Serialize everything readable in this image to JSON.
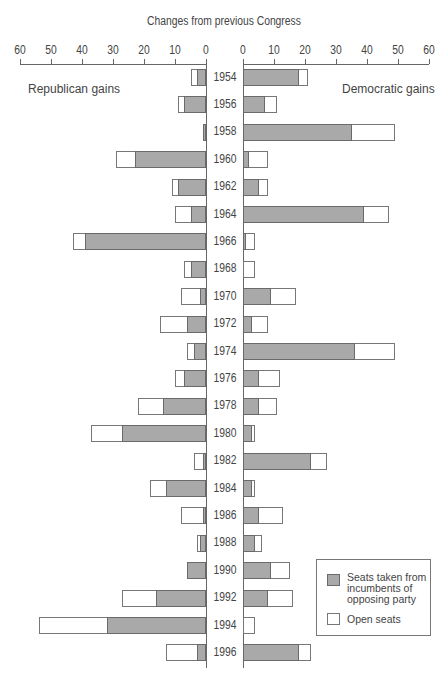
{
  "chart_data": {
    "type": "bar",
    "orientation": "horizontal-diverging",
    "title": "Changes from previous Congress",
    "left_label": "Republican gains",
    "right_label": "Democratic gains",
    "axis_ticks": [
      60,
      50,
      40,
      30,
      20,
      10,
      0
    ],
    "xlim": [
      0,
      60
    ],
    "categories": [
      "1954",
      "1956",
      "1958",
      "1960",
      "1962",
      "1964",
      "1966",
      "1968",
      "1970",
      "1972",
      "1974",
      "1976",
      "1978",
      "1980",
      "1982",
      "1984",
      "1986",
      "1988",
      "1990",
      "1992",
      "1994",
      "1996"
    ],
    "series": [
      {
        "name": "Republican gains - Seats taken from incumbents of opposing party",
        "side": "left",
        "values": [
          3,
          7,
          1,
          23,
          9,
          5,
          39,
          5,
          2,
          6,
          4,
          7,
          14,
          27,
          1,
          13,
          1,
          2,
          6,
          16,
          32,
          3
        ]
      },
      {
        "name": "Republican gains - Total (incl. open seats)",
        "side": "left",
        "values": [
          5,
          9,
          1,
          29,
          11,
          10,
          43,
          7,
          8,
          15,
          6,
          10,
          22,
          37,
          4,
          18,
          8,
          3,
          6,
          27,
          54,
          13
        ]
      },
      {
        "name": "Democratic gains - Seats taken from incumbents of opposing party",
        "side": "right",
        "values": [
          18,
          7,
          35,
          2,
          5,
          39,
          1,
          0,
          9,
          3,
          36,
          5,
          5,
          3,
          22,
          3,
          5,
          4,
          9,
          8,
          0,
          18
        ]
      },
      {
        "name": "Democratic gains - Total (incl. open seats)",
        "side": "right",
        "values": [
          21,
          11,
          49,
          8,
          8,
          47,
          4,
          4,
          17,
          8,
          49,
          12,
          11,
          4,
          27,
          4,
          13,
          6,
          15,
          16,
          4,
          22
        ]
      }
    ],
    "legend": [
      {
        "label": "Seats taken from incumbents of opposing party",
        "color": "#a9a9a9"
      },
      {
        "label": "Open seats",
        "color": "#ffffff"
      }
    ],
    "legend_position": "bottom-right",
    "grid": false
  },
  "colors": {
    "incumbent": "#a9a9a9",
    "open": "#ffffff",
    "stroke": "#6a6a6a"
  }
}
